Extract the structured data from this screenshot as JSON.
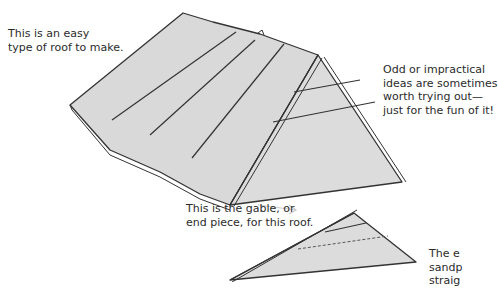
{
  "captions": {
    "easy_roof": [
      "This is an easy",
      "type of roof to make."
    ],
    "odd_ideas": [
      "Odd or impractical",
      "ideas are sometimes",
      "worth trying out—",
      "just for the fun of it!"
    ],
    "gable": [
      "This is the gable, or",
      "end piece, for this roof."
    ],
    "cut_off": [
      "The e",
      "sandp",
      "straig"
    ]
  },
  "colors": {
    "roof_fill": "#d9d9d9",
    "line": "#333333",
    "arrow": "#c8c8c8",
    "text": "#2b2b2b"
  }
}
